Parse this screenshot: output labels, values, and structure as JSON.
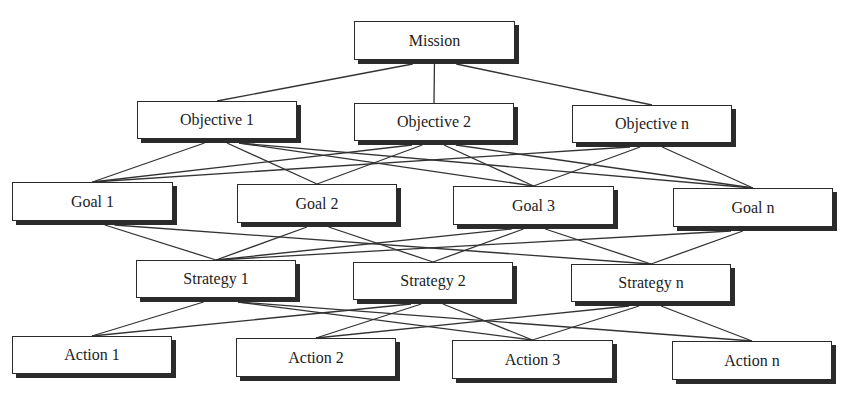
{
  "diagram": {
    "type": "hierarchy",
    "levels": [
      "Mission",
      "Objectives",
      "Goals",
      "Strategies",
      "Actions"
    ],
    "nodes": [
      {
        "id": "mission",
        "label": "Mission",
        "x": 354,
        "y": 21,
        "w": 161,
        "h": 39
      },
      {
        "id": "obj1",
        "label": "Objective 1",
        "x": 137,
        "y": 101,
        "w": 160,
        "h": 38
      },
      {
        "id": "obj2",
        "label": "Objective 2",
        "x": 354,
        "y": 103,
        "w": 160,
        "h": 38
      },
      {
        "id": "objn",
        "label": "Objective n",
        "x": 572,
        "y": 105,
        "w": 160,
        "h": 38
      },
      {
        "id": "goal1",
        "label": "Goal 1",
        "x": 12,
        "y": 182,
        "w": 161,
        "h": 39
      },
      {
        "id": "goal2",
        "label": "Goal 2",
        "x": 237,
        "y": 184,
        "w": 160,
        "h": 39
      },
      {
        "id": "goal3",
        "label": "Goal 3",
        "x": 453,
        "y": 186,
        "w": 161,
        "h": 39
      },
      {
        "id": "goaln",
        "label": "Goal n",
        "x": 673,
        "y": 188,
        "w": 160,
        "h": 39
      },
      {
        "id": "str1",
        "label": "Strategy 1",
        "x": 136,
        "y": 260,
        "w": 160,
        "h": 38
      },
      {
        "id": "str2",
        "label": "Strategy 2",
        "x": 353,
        "y": 262,
        "w": 160,
        "h": 38
      },
      {
        "id": "strn",
        "label": "Strategy n",
        "x": 571,
        "y": 264,
        "w": 160,
        "h": 38
      },
      {
        "id": "act1",
        "label": "Action 1",
        "x": 12,
        "y": 336,
        "w": 160,
        "h": 38
      },
      {
        "id": "act2",
        "label": "Action 2",
        "x": 236,
        "y": 338,
        "w": 160,
        "h": 39
      },
      {
        "id": "act3",
        "label": "Action 3",
        "x": 452,
        "y": 340,
        "w": 161,
        "h": 39
      },
      {
        "id": "actn",
        "label": "Action n",
        "x": 672,
        "y": 341,
        "w": 160,
        "h": 39
      }
    ],
    "edges": [
      {
        "from": "mission",
        "to": "obj1"
      },
      {
        "from": "mission",
        "to": "obj2"
      },
      {
        "from": "mission",
        "to": "objn"
      },
      {
        "from": "obj1",
        "to": "goal1"
      },
      {
        "from": "obj1",
        "to": "goal2"
      },
      {
        "from": "obj1",
        "to": "goal3"
      },
      {
        "from": "obj1",
        "to": "goaln"
      },
      {
        "from": "obj2",
        "to": "goal1"
      },
      {
        "from": "obj2",
        "to": "goal2"
      },
      {
        "from": "obj2",
        "to": "goal3"
      },
      {
        "from": "obj2",
        "to": "goaln"
      },
      {
        "from": "objn",
        "to": "goal1"
      },
      {
        "from": "objn",
        "to": "goal3"
      },
      {
        "from": "objn",
        "to": "goaln"
      },
      {
        "from": "goal1",
        "to": "str1"
      },
      {
        "from": "goal1",
        "to": "strn"
      },
      {
        "from": "goal2",
        "to": "str1"
      },
      {
        "from": "goal2",
        "to": "str2"
      },
      {
        "from": "goal3",
        "to": "str1"
      },
      {
        "from": "goal3",
        "to": "str2"
      },
      {
        "from": "goal3",
        "to": "strn"
      },
      {
        "from": "goaln",
        "to": "str1"
      },
      {
        "from": "goaln",
        "to": "strn"
      },
      {
        "from": "str1",
        "to": "act1"
      },
      {
        "from": "str1",
        "to": "act3"
      },
      {
        "from": "str1",
        "to": "actn"
      },
      {
        "from": "str2",
        "to": "act1"
      },
      {
        "from": "str2",
        "to": "act2"
      },
      {
        "from": "str2",
        "to": "act3"
      },
      {
        "from": "strn",
        "to": "act2"
      },
      {
        "from": "strn",
        "to": "act3"
      },
      {
        "from": "strn",
        "to": "actn"
      }
    ],
    "colors": {
      "line": "#333333",
      "border": "#2a2a2a",
      "shadow": "#2b2b2b",
      "box_fill": "#ffffff",
      "text": "#222222"
    }
  },
  "labels": {
    "mission": "Mission",
    "obj1": "Objective 1",
    "obj2": "Objective 2",
    "objn": "Objective n",
    "goal1": "Goal 1",
    "goal2": "Goal 2",
    "goal3": "Goal 3",
    "goaln": "Goal n",
    "str1": "Strategy 1",
    "str2": "Strategy 2",
    "strn": "Strategy n",
    "act1": "Action 1",
    "act2": "Action 2",
    "act3": "Action 3",
    "actn": "Action n"
  }
}
